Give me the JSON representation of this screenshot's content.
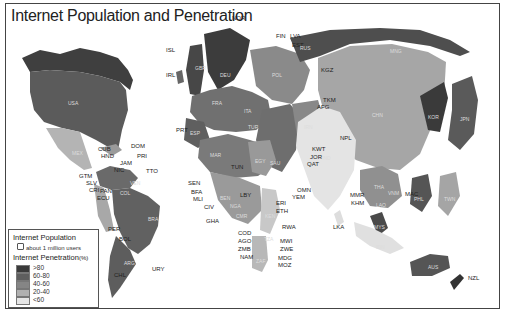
{
  "title": "Internet Population and Penetration",
  "legend": {
    "population_title": "Internet Population",
    "population_unit_icon": "hexagon-icon",
    "population_unit": "about 1 million users",
    "penetration_title": "Internet Penetration",
    "penetration_unit": "(%)",
    "classes": [
      {
        "label": ">80",
        "color": "#3a3a3a"
      },
      {
        "label": "60-80",
        "color": "#5e5e5e"
      },
      {
        "label": "40-60",
        "color": "#858585"
      },
      {
        "label": "20-40",
        "color": "#b0b0b0"
      },
      {
        "label": "<60",
        "color": "#e6e6e6"
      }
    ]
  },
  "countries": {
    "outside": [
      "NOR",
      "FIN",
      "LVA",
      "EST",
      "ISL",
      "IRL",
      "PRT",
      "CUB",
      "DOM",
      "HND",
      "PRI",
      "JAM",
      "GTM",
      "SLV",
      "CRI",
      "NIC",
      "PAN",
      "TTO",
      "ECU",
      "PER",
      "BOL",
      "CHL",
      "URY",
      "SEN",
      "BFA",
      "MLI",
      "CIV",
      "GHA",
      "TUN",
      "LBY",
      "KWT",
      "JOR",
      "QAT",
      "OMN",
      "YEM",
      "ERI",
      "ETH",
      "RWA",
      "COD",
      "AGO",
      "ZMB",
      "NAM",
      "MWI",
      "ZWE",
      "MDG",
      "MOZ",
      "LKA",
      "MMR",
      "KHM",
      "MAC",
      "NZL",
      "KGZ",
      "TKM",
      "AFG",
      "NPL",
      "BGD"
    ],
    "inside": [
      "USA",
      "CAN",
      "MEX",
      "COL",
      "VEN",
      "BRA",
      "ARG",
      "GBR",
      "FRA",
      "ESP",
      "ITA",
      "DEU",
      "POL",
      "SWE",
      "RUS",
      "UKR",
      "TUR",
      "IRN",
      "SAU",
      "EGY",
      "DZA",
      "MAR",
      "NGA",
      "KEN",
      "ZAF",
      "TZA",
      "SDN",
      "IND",
      "PAK",
      "CHN",
      "MNG",
      "KAZ",
      "UZB",
      "KOR",
      "JPN",
      "PHL",
      "THA",
      "VNM",
      "MYS",
      "IDN",
      "AUS",
      "TWN",
      "LAO"
    ]
  },
  "labels": {
    "nor": "NOR",
    "fin": "FIN",
    "lva": "LVA",
    "est": "EST",
    "isl": "ISL",
    "irl": "IRL",
    "prt": "PRT",
    "cub": "CUB",
    "dom": "DOM",
    "hnd": "HND",
    "pri": "PRI",
    "jam": "JAM",
    "gtm": "GTM",
    "slv": "SLV",
    "cri": "CRI",
    "nic": "NIC",
    "pan": "PAN",
    "tto": "TTO",
    "ecu": "ECU",
    "per": "PER",
    "bol": "BOL",
    "chl": "CHL",
    "ury": "URY",
    "sen": "SEN",
    "bfa": "BFA",
    "mli": "MLI",
    "civ": "CIV",
    "gha": "GHA",
    "tun": "TUN",
    "lby": "LBY",
    "kwt": "KWT",
    "jor": "JOR",
    "qat": "QAT",
    "omn": "OMN",
    "yem": "YEM",
    "eri": "ERI",
    "eth": "ETH",
    "rwa": "RWA",
    "cod": "COD",
    "ago": "AGO",
    "zmb": "ZMB",
    "nam": "NAM",
    "mwi": "MWI",
    "zwe": "ZWE",
    "mdg": "MDG",
    "moz": "MOZ",
    "lka": "LKA",
    "mmr": "MMR",
    "khm": "KHM",
    "mac": "MAC",
    "nzl": "NZL",
    "kgz": "KGZ",
    "tkm": "TKM",
    "afg": "AFG",
    "npl": "NPL",
    "bgd": "BGD",
    "usa": "USA",
    "mex": "MEX",
    "col": "COL",
    "ven": "VEN",
    "bra": "BRA",
    "arg": "ARG",
    "gbr": "GBR",
    "fra": "FRA",
    "esp": "ESP",
    "deu": "DEU",
    "ita": "ITA",
    "pol": "POL",
    "rus": "RUS",
    "tur": "TUR",
    "irn": "IRN",
    "sau": "SAU",
    "egy": "EGY",
    "dza": "DZA",
    "mar": "MAR",
    "nga": "NGA",
    "ken": "KEN",
    "zaf": "ZAF",
    "tza": "TZA",
    "cmr": "CMR",
    "ben": "BEN",
    "uga": "UGA",
    "ind": "IND",
    "chn": "CHN",
    "mng": "MNG",
    "kor": "KOR",
    "jpn": "JPN",
    "phl": "PHL",
    "tha": "THA",
    "vnm": "VNM",
    "mys": "MYS",
    "idn": "IDN",
    "aus": "AUS",
    "twn": "TWN",
    "lao": "LAO"
  }
}
